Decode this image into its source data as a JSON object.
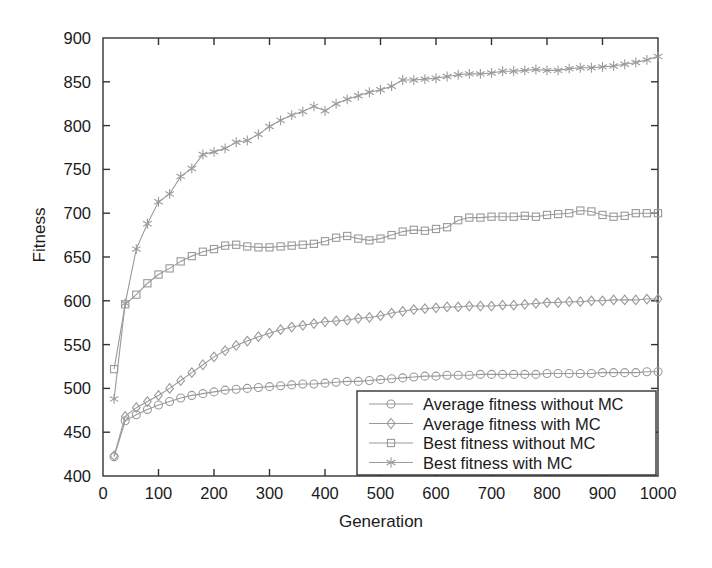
{
  "chart_data": {
    "type": "line",
    "title": "",
    "xlabel": "Generation",
    "ylabel": "Fitness",
    "xlim": [
      0,
      1000
    ],
    "ylim": [
      400,
      900
    ],
    "xticks": [
      0,
      100,
      200,
      300,
      400,
      500,
      600,
      700,
      800,
      900,
      1000
    ],
    "yticks": [
      400,
      450,
      500,
      550,
      600,
      650,
      700,
      750,
      800,
      850,
      900
    ],
    "grid": false,
    "legend_position": "lower right",
    "line_color": "#9a9a9a",
    "axis_color": "#333333",
    "background": "#ffffff",
    "x": [
      20,
      40,
      60,
      80,
      100,
      120,
      140,
      160,
      180,
      200,
      220,
      240,
      260,
      280,
      300,
      320,
      340,
      360,
      380,
      400,
      420,
      440,
      460,
      480,
      500,
      520,
      540,
      560,
      580,
      600,
      620,
      640,
      660,
      680,
      700,
      720,
      740,
      760,
      780,
      800,
      820,
      840,
      860,
      880,
      900,
      920,
      940,
      960,
      980,
      1000
    ],
    "series": [
      {
        "name": "Average fitness without MC",
        "marker": "circle",
        "values": [
          422,
          463,
          470,
          476,
          481,
          485,
          489,
          492,
          494,
          496,
          498,
          499,
          500,
          501,
          502,
          503,
          504,
          505,
          505,
          506,
          507,
          508,
          508,
          509,
          510,
          511,
          512,
          513,
          514,
          514,
          515,
          515,
          515,
          516,
          516,
          516,
          516,
          516,
          516,
          517,
          517,
          517,
          517,
          517,
          518,
          518,
          518,
          518,
          519,
          519
        ]
      },
      {
        "name": "Average fitness with MC",
        "marker": "diamond",
        "values": [
          423,
          468,
          478,
          485,
          492,
          500,
          509,
          518,
          527,
          536,
          543,
          549,
          554,
          559,
          563,
          567,
          570,
          572,
          574,
          576,
          577,
          578,
          580,
          581,
          583,
          586,
          588,
          590,
          591,
          592,
          593,
          593,
          594,
          594,
          594,
          595,
          595,
          596,
          597,
          598,
          598,
          599,
          599,
          600,
          600,
          601,
          601,
          601,
          602,
          602
        ]
      },
      {
        "name": "Best fitness without MC",
        "marker": "square",
        "values": [
          522,
          596,
          607,
          620,
          630,
          637,
          645,
          651,
          656,
          659,
          663,
          664,
          662,
          661,
          661,
          662,
          663,
          664,
          665,
          668,
          672,
          674,
          671,
          669,
          671,
          675,
          679,
          681,
          680,
          682,
          684,
          692,
          695,
          695,
          696,
          696,
          696,
          697,
          696,
          698,
          699,
          700,
          703,
          702,
          698,
          696,
          697,
          700,
          700,
          700
        ]
      },
      {
        "name": "Best fitness with MC",
        "marker": "asterisk",
        "values": [
          488,
          597,
          659,
          688,
          713,
          722,
          742,
          751,
          767,
          770,
          774,
          781,
          783,
          790,
          799,
          806,
          812,
          816,
          822,
          817,
          825,
          830,
          834,
          838,
          841,
          845,
          852,
          852,
          853,
          854,
          856,
          858,
          859,
          859,
          860,
          862,
          862,
          863,
          864,
          863,
          863,
          865,
          866,
          866,
          867,
          868,
          870,
          872,
          875,
          879
        ]
      }
    ]
  },
  "legend": {
    "items": [
      {
        "label": "Average fitness without MC",
        "marker": "circle"
      },
      {
        "label": "Average fitness with MC",
        "marker": "diamond"
      },
      {
        "label": "Best fitness without MC",
        "marker": "square"
      },
      {
        "label": "Best fitness with MC",
        "marker": "asterisk"
      }
    ]
  }
}
